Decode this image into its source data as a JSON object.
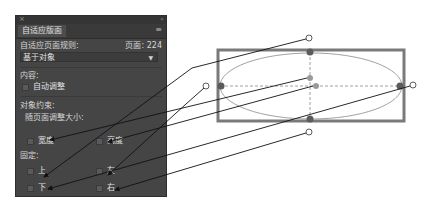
{
  "panel": {
    "close_icon": "×",
    "collapse_icon": "»",
    "tab_label": "自适应版面",
    "menu_icon": "≡",
    "rule_label": "自适应页面规则:",
    "page_label": "页面: 224",
    "rule_select": "基于对象",
    "content_heading": "内容:",
    "auto_fit_label": "自动调整",
    "constraints_heading": "对象约束:",
    "resize_heading": "随页面调整大小:",
    "width_label": "宽度",
    "height_label": "高度",
    "pin_heading": "固定:",
    "top_label": "上",
    "left_label": "左",
    "bottom_label": "下",
    "right_label": "右"
  },
  "colors": {
    "panel_bg": "#454545",
    "frame_stroke": "#7a7a7a",
    "handle_fill": "#5b5b5b",
    "connector": "#1a1a1a"
  }
}
